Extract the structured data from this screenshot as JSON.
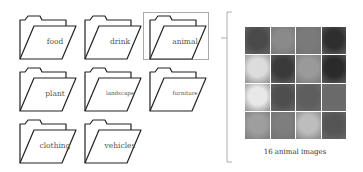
{
  "folders": [
    {
      "label": "food",
      "x": 18,
      "y": 14
    },
    {
      "label": "drink",
      "x": 83,
      "y": 14
    },
    {
      "label": "animal",
      "x": 148,
      "y": 14,
      "selected": true
    },
    {
      "label": "plant",
      "x": 18,
      "y": 66
    },
    {
      "label": "landscape",
      "x": 83,
      "y": 66
    },
    {
      "label": "furniture",
      "x": 148,
      "y": 66
    },
    {
      "label": "clothing",
      "x": 18,
      "y": 118
    },
    {
      "label": "vehicles",
      "x": 83,
      "y": 118
    }
  ],
  "selected_folder": "animal",
  "image_grid": {
    "rows": 4,
    "cols": 4,
    "tiles": [
      {
        "subject": "owl",
        "color": "#4a4a4a"
      },
      {
        "subject": "horses",
        "color": "#8a8a8a"
      },
      {
        "subject": "reptile",
        "color": "#7a7a7a"
      },
      {
        "subject": "lion",
        "color": "#2e2e2e"
      },
      {
        "subject": "cats",
        "color": "#dcdcdc"
      },
      {
        "subject": "horse",
        "color": "#3a3a3a"
      },
      {
        "subject": "penguin",
        "color": "#9a9a9a"
      },
      {
        "subject": "panda",
        "color": "#2a2a2a"
      },
      {
        "subject": "dog",
        "color": "#e8e8e8"
      },
      {
        "subject": "hamster",
        "color": "#4e4e4e"
      },
      {
        "subject": "tiger",
        "color": "#5e5e5e"
      },
      {
        "subject": "bird",
        "color": "#6a6a6a"
      },
      {
        "subject": "rabbit",
        "color": "#9e9e9e"
      },
      {
        "subject": "bird",
        "color": "#7e7e7e"
      },
      {
        "subject": "cat",
        "color": "#bdbdbd"
      },
      {
        "subject": "giraffe",
        "color": "#555555"
      }
    ]
  },
  "caption": "16 animal images"
}
